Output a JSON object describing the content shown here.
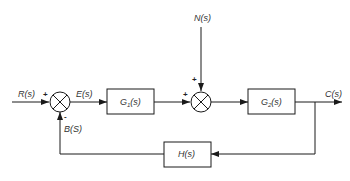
{
  "diagram": {
    "type": "closed-loop control block diagram",
    "colors": {
      "line": "#1a1a1a",
      "text": "#333333",
      "background": "#ffffff"
    },
    "signals": {
      "input": "R(s)",
      "error": "E(s)",
      "disturbance": "N(s)",
      "output": "C(s)",
      "feedback": "B(S)"
    },
    "blocks": {
      "g1": {
        "name": "G",
        "sub": "1",
        "arg": "(s)"
      },
      "g2": {
        "name": "G",
        "sub": "2",
        "arg": "(s)"
      },
      "h": {
        "label": "H(s)"
      }
    },
    "summing_junctions": {
      "s1": {
        "signs": {
          "left": "+",
          "bottom": "-"
        }
      },
      "s2": {
        "signs": {
          "left": "+",
          "top": "+"
        }
      }
    }
  }
}
